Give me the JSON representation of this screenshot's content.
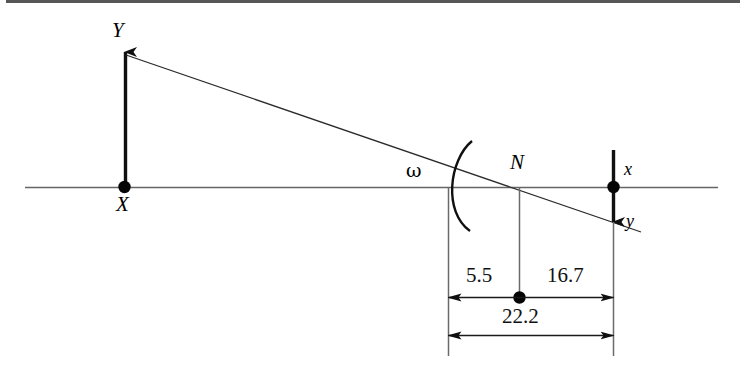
{
  "figure": {
    "type": "ray-diagram",
    "background_color": "#ffffff",
    "line_color": "#1a1a1a",
    "axis_color": "#555555"
  },
  "labels": {
    "object_tip": "Y",
    "object_base": "X",
    "mirror_node": "N",
    "image_tip": "y",
    "image_base": "x",
    "angle": "ω"
  },
  "dimensions": {
    "left_segment": "5.5",
    "right_segment": "16.7",
    "total_span": "22.2"
  },
  "geometry": {
    "axis": {
      "x1": 25,
      "y1": 187,
      "x2": 718,
      "y2": 187
    },
    "object_arrow": {
      "x": 125,
      "y_base": 187,
      "y_tip": 50
    },
    "image_arrow": {
      "x": 613,
      "y_base": 187,
      "y_tip": 224
    },
    "ray": {
      "x1": 126,
      "y1": 55,
      "x2": 640,
      "y2": 232
    },
    "mirror_arc": {
      "vertex_x": 453,
      "top_y": 141,
      "bottom_y": 231
    },
    "node_point": {
      "x": 519,
      "y": 187
    },
    "object_point": {
      "x": 124,
      "y": 187
    },
    "image_point": {
      "x": 613,
      "y": 187
    },
    "center_point": {
      "x": 519,
      "y": 297
    },
    "dim_line_upper_y": 297,
    "dim_line_lower_y": 335,
    "ext_left_x": 448,
    "ext_right_x": 613,
    "ext_bottom_y": 356
  }
}
